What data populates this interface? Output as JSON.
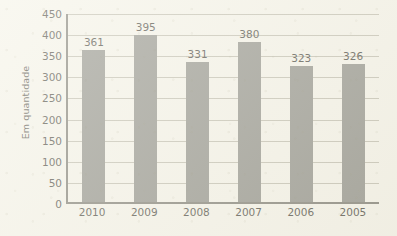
{
  "chart_data": {
    "type": "bar",
    "title": "",
    "subtitle": "",
    "xlabel": "",
    "ylabel": "Em quantidade",
    "categories": [
      "2010",
      "2009",
      "2008",
      "2007",
      "2006",
      "2005"
    ],
    "values": [
      361,
      395,
      331,
      380,
      323,
      326
    ],
    "data_labels": [
      "361",
      "395",
      "331",
      "380",
      "323",
      "326"
    ],
    "ylim": [
      0,
      450
    ],
    "ytick_step": 50,
    "ytick_labels": [
      "450",
      "400",
      "350",
      "300",
      "250",
      "200",
      "150",
      "100",
      "50",
      "0"
    ],
    "ytick_values": [
      450,
      400,
      350,
      300,
      250,
      200,
      150,
      100,
      50,
      0
    ],
    "grid": "horizontal",
    "legend": "none",
    "orientation": "vertical",
    "colors": {
      "bar": "#83837c",
      "background": "#f3f1e7",
      "gridline": "#b9b6a7",
      "axis": "#6e6c63",
      "text": "#35332b"
    }
  }
}
